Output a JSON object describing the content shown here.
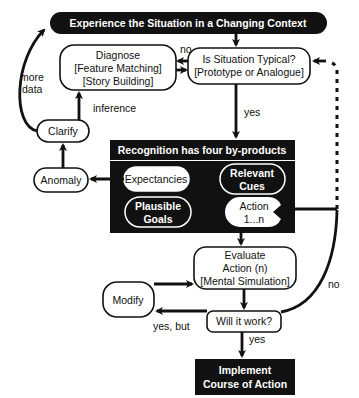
{
  "title": "Experience the Situation in a Changing Context",
  "nodes": {
    "diagnose": {
      "line1": "Diagnose",
      "line2": "[Feature Matching]",
      "line3": "[Story Building]"
    },
    "typical": {
      "line1": "Is Situation Typical?",
      "line2": "[Prototype or Analogue]"
    },
    "clarify": "Clarify",
    "anomaly": "Anomaly",
    "recognition": {
      "header": "Recognition has four by-products",
      "expectancies": "Expectancies",
      "cues": {
        "line1": "Relevant",
        "line2": "Cues"
      },
      "goals": {
        "line1": "Plausible",
        "line2": "Goals"
      },
      "action": {
        "line1": "Action",
        "line2": "1...n"
      }
    },
    "evaluate": {
      "line1": "Evaluate",
      "line2": "Action (n)",
      "line3": "[Mental Simulation]"
    },
    "modify": "Modify",
    "work": "Will it work?",
    "implement": {
      "line1": "Implement",
      "line2": "Course of Action"
    }
  },
  "labels": {
    "no_top": "no",
    "more_data_1": "more",
    "more_data_2": "data",
    "inference": "inference",
    "yes_mid": "yes",
    "yes_but": "yes, but",
    "yes_bottom": "yes",
    "no_right": "no"
  },
  "colors": {
    "ink": "#111111",
    "paper": "#ffffff"
  }
}
